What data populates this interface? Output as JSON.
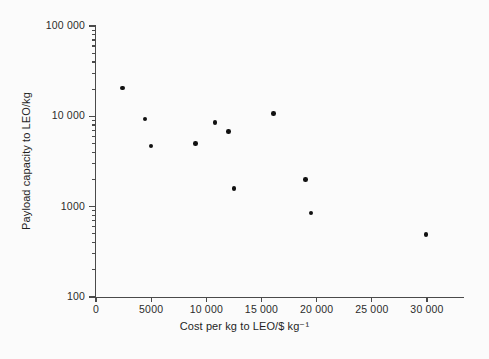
{
  "chart_data": {
    "type": "scatter",
    "title": "",
    "xlabel": "Cost per kg to LEO/$ kg⁻¹",
    "ylabel": "Payload capacity to LEO/kg",
    "xscale": "linear",
    "yscale": "log",
    "xlim": [
      0,
      33000
    ],
    "ylim": [
      100,
      100000
    ],
    "grid": false,
    "legend": null,
    "x_ticks": [
      {
        "value": 0,
        "label": "0"
      },
      {
        "value": 5000,
        "label": "5000"
      },
      {
        "value": 10000,
        "label": "10 000"
      },
      {
        "value": 15000,
        "label": "15 000"
      },
      {
        "value": 20000,
        "label": "20 000"
      },
      {
        "value": 25000,
        "label": "25 000"
      },
      {
        "value": 30000,
        "label": "30 000"
      }
    ],
    "y_ticks": [
      {
        "value": 100,
        "label": "100"
      },
      {
        "value": 1000,
        "label": "1000"
      },
      {
        "value": 10000,
        "label": "10 000"
      },
      {
        "value": 100000,
        "label": "100 000"
      }
    ],
    "y_minor_ticks": [
      200,
      300,
      400,
      500,
      600,
      700,
      800,
      900,
      2000,
      3000,
      4000,
      5000,
      6000,
      7000,
      8000,
      9000,
      20000,
      30000,
      40000,
      50000,
      60000,
      70000,
      80000,
      90000
    ],
    "marker": {
      "shape": "circle",
      "color": "#111111",
      "size": 4.6
    },
    "points": [
      {
        "x": 2400,
        "y": 20500
      },
      {
        "x": 4450,
        "y": 9300
      },
      {
        "x": 5000,
        "y": 4700
      },
      {
        "x": 9000,
        "y": 5000
      },
      {
        "x": 10800,
        "y": 8600
      },
      {
        "x": 12000,
        "y": 6800
      },
      {
        "x": 12500,
        "y": 1600
      },
      {
        "x": 16100,
        "y": 10800
      },
      {
        "x": 19000,
        "y": 2000
      },
      {
        "x": 19500,
        "y": 850
      },
      {
        "x": 29900,
        "y": 490
      }
    ]
  },
  "figure": {
    "background_color": "#fbfbfb",
    "axis_color": "#4a4a4a",
    "text_color": "#1f1f1f"
  }
}
